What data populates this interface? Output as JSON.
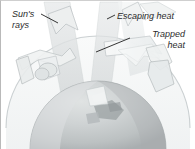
{
  "figure": {
    "background_color": "#ffffff",
    "border_color": "#b9b9b9"
  },
  "labels": {
    "suns_rays": "Sun's\nrays",
    "escaping_heat": "Escaping heat",
    "trapped_heat": "Trapped\nheat"
  },
  "colors": {
    "text": "#2b2b2b",
    "leader_line": "#1c1c1c",
    "atmosphere_dome": "#e9eced",
    "dome_outline": "#c4cacc",
    "earth_light": "#d3d6d6",
    "earth_mid": "#c2c6c7",
    "earth_dark": "#aeb3b4",
    "incoming_ray": "#dcdfe0",
    "escaping_ray": "#e4e7e8",
    "trapped_arrow": "#f2f4f4",
    "arrow_outline": "#b9bfc1",
    "surface_detail": "#9aa0a2"
  },
  "diagram_elements": {
    "atmosphere": "dome-arc",
    "planet": "earth-sphere",
    "incoming_arrows": 2,
    "escaping_arrows": 2,
    "trapped_arrows": 3,
    "leader_lines": 3
  }
}
